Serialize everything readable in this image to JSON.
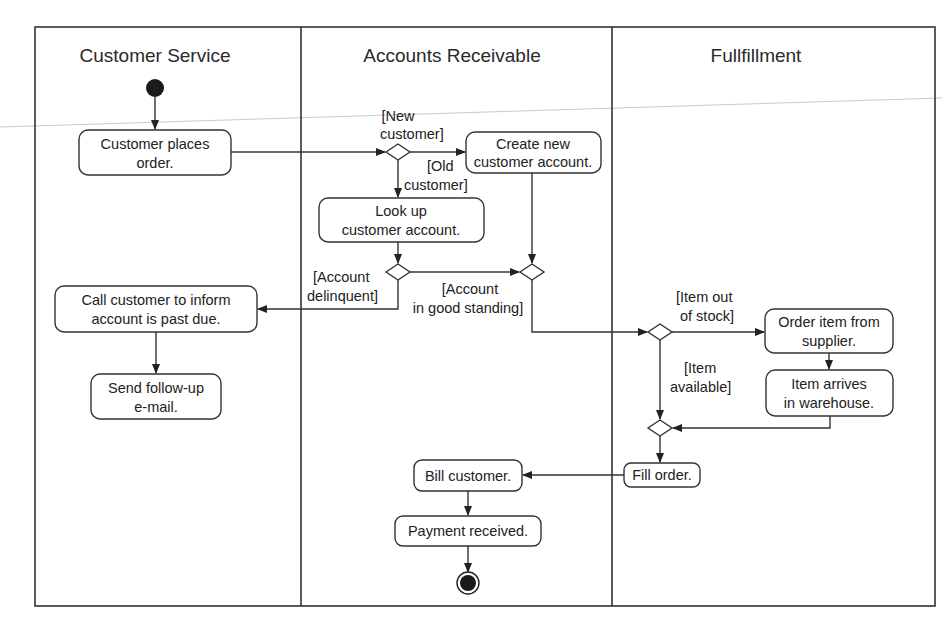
{
  "diagram": {
    "type": "UML activity diagram with swimlanes",
    "lanes": [
      {
        "id": "cs",
        "title": "Customer Service"
      },
      {
        "id": "ar",
        "title": "Accounts Receivable"
      },
      {
        "id": "ff",
        "title": "Fullfillment"
      }
    ],
    "nodes": {
      "start": {
        "type": "initial"
      },
      "place_order": {
        "lane": "cs",
        "lines": [
          "Customer places",
          "order."
        ]
      },
      "create_account": {
        "lane": "ar",
        "lines": [
          "Create new",
          "customer account."
        ]
      },
      "lookup_account": {
        "lane": "ar",
        "lines": [
          "Look up",
          "customer account."
        ]
      },
      "call_customer": {
        "lane": "cs",
        "lines": [
          "Call customer to inform",
          "account is past due."
        ]
      },
      "send_email": {
        "lane": "cs",
        "lines": [
          "Send follow-up",
          "e-mail."
        ]
      },
      "order_item": {
        "lane": "ff",
        "lines": [
          "Order item from",
          "supplier."
        ]
      },
      "item_arrives": {
        "lane": "ff",
        "lines": [
          "Item arrives",
          "in warehouse."
        ]
      },
      "fill_order": {
        "lane": "ff",
        "lines": [
          "Fill order."
        ]
      },
      "bill_customer": {
        "lane": "ar",
        "lines": [
          "Bill customer."
        ]
      },
      "payment_received": {
        "lane": "ar",
        "lines": [
          "Payment received."
        ]
      },
      "end": {
        "type": "final"
      }
    },
    "guards": {
      "new_customer": [
        "[New",
        "customer]"
      ],
      "old_customer": [
        "[Old",
        "customer]"
      ],
      "account_delinquent": [
        "[Account",
        "delinquent]"
      ],
      "account_good": [
        "[Account",
        "in good standing]"
      ],
      "item_out_of_stock": [
        "[Item out",
        "of stock]"
      ],
      "item_available": [
        "[Item",
        "available]"
      ]
    },
    "edges": [
      {
        "from": "start",
        "to": "place_order"
      },
      {
        "from": "place_order",
        "to": "decision_customer_type"
      },
      {
        "from": "decision_customer_type",
        "to": "create_account",
        "guard": "[New customer]"
      },
      {
        "from": "decision_customer_type",
        "to": "lookup_account",
        "guard": "[Old customer]"
      },
      {
        "from": "lookup_account",
        "to": "decision_account_status"
      },
      {
        "from": "decision_account_status",
        "to": "call_customer",
        "guard": "[Account delinquent]"
      },
      {
        "from": "decision_account_status",
        "to": "merge_account",
        "guard": "[Account in good standing]"
      },
      {
        "from": "create_account",
        "to": "merge_account"
      },
      {
        "from": "call_customer",
        "to": "send_email"
      },
      {
        "from": "merge_account",
        "to": "decision_stock"
      },
      {
        "from": "decision_stock",
        "to": "order_item",
        "guard": "[Item out of stock]"
      },
      {
        "from": "decision_stock",
        "to": "merge_stock",
        "guard": "[Item available]"
      },
      {
        "from": "order_item",
        "to": "item_arrives"
      },
      {
        "from": "item_arrives",
        "to": "merge_stock"
      },
      {
        "from": "merge_stock",
        "to": "fill_order"
      },
      {
        "from": "fill_order",
        "to": "bill_customer"
      },
      {
        "from": "bill_customer",
        "to": "payment_received"
      },
      {
        "from": "payment_received",
        "to": "end"
      }
    ]
  }
}
